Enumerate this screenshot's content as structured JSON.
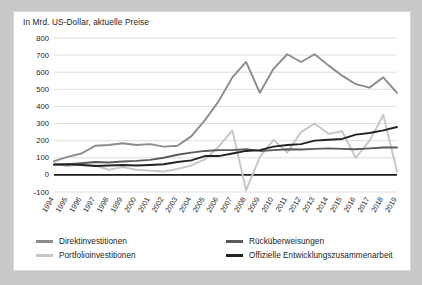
{
  "chart_data": {
    "type": "line",
    "title": "In Mrd. US-Dollar, aktuelle Preise",
    "xlabel": "",
    "ylabel": "",
    "ylim": [
      -100,
      800
    ],
    "ytick_step": 100,
    "yticks": [
      "800",
      "700",
      "600",
      "500",
      "400",
      "300",
      "200",
      "100",
      "0",
      "-100"
    ],
    "grid": true,
    "legend_position": "bottom",
    "x": [
      "1994",
      "1995",
      "1996",
      "1997",
      "1998",
      "1999",
      "2000",
      "2001",
      "2002",
      "2003",
      "2004",
      "2005",
      "2006",
      "2007",
      "2008",
      "2009",
      "2010",
      "2011",
      "2012",
      "2013",
      "2014",
      "2015",
      "2016",
      "2017",
      "2018",
      "2019"
    ],
    "series": [
      {
        "name": "Direktinvestitionen",
        "color": "#8c8c8c",
        "values": [
          80,
          105,
          125,
          170,
          175,
          185,
          175,
          180,
          165,
          170,
          225,
          320,
          430,
          570,
          660,
          480,
          620,
          705,
          660,
          705,
          640,
          580,
          530,
          510,
          570,
          480
        ]
      },
      {
        "name": "Portfolioinvestitionen",
        "color": "#c6c6c6",
        "values": [
          70,
          50,
          65,
          55,
          30,
          45,
          30,
          25,
          20,
          35,
          55,
          90,
          165,
          260,
          -90,
          105,
          205,
          130,
          250,
          300,
          240,
          255,
          100,
          200,
          350,
          20
        ]
      },
      {
        "name": "Rücküberweisungen",
        "color": "#5a5a5a",
        "values": [
          60,
          62,
          68,
          75,
          72,
          78,
          82,
          88,
          100,
          118,
          130,
          140,
          145,
          145,
          150,
          140,
          145,
          150,
          148,
          152,
          155,
          152,
          150,
          155,
          160,
          160
        ]
      },
      {
        "name": "Offizielle Entwicklungszusammenarbeit",
        "color": "#222222",
        "values": [
          60,
          62,
          58,
          52,
          55,
          58,
          55,
          58,
          62,
          75,
          85,
          110,
          110,
          125,
          140,
          145,
          165,
          175,
          180,
          200,
          205,
          210,
          235,
          245,
          260,
          280
        ]
      }
    ]
  },
  "legend": {
    "left": [
      {
        "label": "Direktinvestitionen",
        "color": "#8c8c8c"
      },
      {
        "label": "Portfolioinvestitionen",
        "color": "#c6c6c6"
      }
    ],
    "right": [
      {
        "label": "Rücküberweisungen",
        "color": "#5a5a5a"
      },
      {
        "label": "Offizielle Entwicklungszusammenarbeit",
        "color": "#222222"
      }
    ]
  }
}
